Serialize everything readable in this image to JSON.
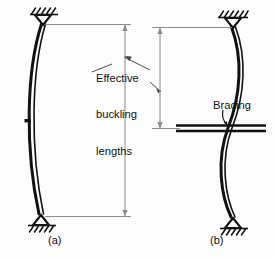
{
  "figure": {
    "type": "engineering-diagram",
    "background_color": "#fdfdfd",
    "line_color": "#111111",
    "dimension_line_color": "#7a7a7a",
    "annotations": {
      "effective_buckling_lengths": {
        "line1": "Effective",
        "line2": "buckling",
        "line3": "lengths"
      },
      "bracing": "Bracing"
    },
    "captions": {
      "a": "(a)",
      "b": "(b)"
    },
    "panels": [
      {
        "id": "a",
        "caption": "(a)",
        "top_support": "pin-support-hatched",
        "bottom_support": "pin-support-hatched",
        "bracing": "none",
        "buckled_shape": "single-half-sine-bow",
        "effective_length_segments": 1,
        "column_top_y": 24,
        "column_bottom_y": 216,
        "dimension_x": 125,
        "dimension_top_y": 24,
        "dimension_bottom_y": 216
      },
      {
        "id": "b",
        "caption": "(b)",
        "top_support": "pin-support-hatched",
        "bottom_support": "pin-support-hatched",
        "bracing": "mid-height-horizontal-brace",
        "bracing_y": 128,
        "buckled_shape": "double-curvature-s-shape",
        "effective_length_segments": 2,
        "column_top_y": 27,
        "column_bottom_y": 219,
        "dimension_x": 160,
        "dimension_top_y": 27,
        "dimension_bottom_y": 128
      }
    ]
  }
}
